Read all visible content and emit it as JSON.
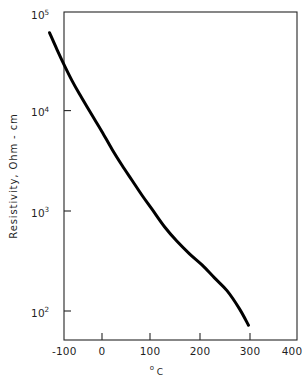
{
  "chart_data": {
    "type": "line",
    "title": "",
    "subtitle": "",
    "xlabel": "°C",
    "ylabel": "Resistivity, Ohm - cm",
    "xlabel_parts": {
      "degree": "o",
      "unit": "C"
    },
    "yscale": "log",
    "xscale": "linear",
    "xlim": [
      -150,
      400
    ],
    "ylim": [
      100,
      100000
    ],
    "grid": false,
    "legend": null,
    "legend_position": "none",
    "xticks": [
      -100,
      0,
      100,
      200,
      300,
      400
    ],
    "xticklabels": [
      "-100",
      "0",
      "100",
      "200",
      "300",
      "400"
    ],
    "yticks": [
      100,
      1000,
      10000,
      100000
    ],
    "yticklabels": [
      "10",
      "10",
      "10",
      "10"
    ],
    "yticklabel_exponents": [
      "2",
      "3",
      "4",
      "5"
    ],
    "yticklabels_full": [
      "10^2",
      "10^3",
      "10^4",
      "10^5"
    ],
    "series": [
      {
        "name": "resistivity",
        "color": "#000000",
        "x": [
          -105,
          -90,
          -75,
          -60,
          -45,
          -30,
          -15,
          0,
          20,
          40,
          60,
          80,
          100,
          125,
          150,
          175,
          200,
          225,
          250,
          275,
          293
        ],
        "y": [
          62000,
          42000,
          29000,
          20500,
          15000,
          11200,
          8400,
          6300,
          4200,
          2900,
          2050,
          1450,
          1050,
          700,
          500,
          375,
          290,
          215,
          160,
          105,
          72
        ]
      }
    ],
    "annotations": []
  },
  "figure": {
    "background_color": "#ffffff",
    "axis_color": "#252525",
    "curve_color": "#000000"
  }
}
